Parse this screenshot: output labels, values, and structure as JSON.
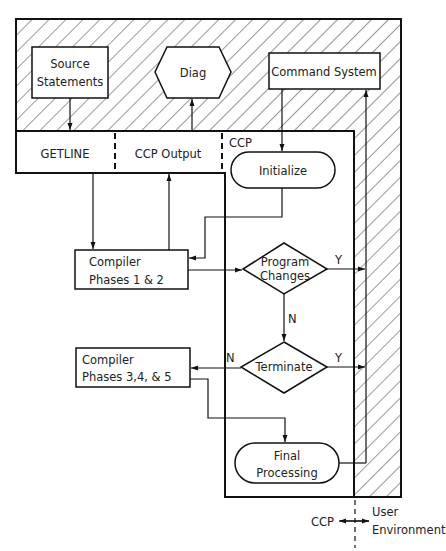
{
  "diagram": {
    "type": "flowchart",
    "regions": {
      "ccp_label": "CCP",
      "divider_left": "CCP",
      "divider_right_line1": "User",
      "divider_right_line2": "Environment"
    },
    "nodes": {
      "source_statements": {
        "line1": "Source",
        "line2": "Statements",
        "shape": "rectangle"
      },
      "diag": {
        "label": "Diag",
        "shape": "hexagon"
      },
      "command_system": {
        "label": "Command System",
        "shape": "rectangle"
      },
      "getline": {
        "label": "GETLINE",
        "shape": "rectangle"
      },
      "ccp_output": {
        "label": "CCP Output",
        "shape": "rectangle"
      },
      "initialize": {
        "label": "Initialize",
        "shape": "terminator"
      },
      "compiler_12": {
        "line1": "Compiler",
        "line2": "Phases 1 & 2",
        "shape": "rectangle"
      },
      "program_changes": {
        "line1": "Program",
        "line2": "Changes",
        "shape": "decision"
      },
      "terminate": {
        "label": "Terminate",
        "shape": "decision"
      },
      "compiler_345": {
        "line1": "Compiler",
        "line2": "Phases 3,4, & 5",
        "shape": "rectangle"
      },
      "final_processing": {
        "line1": "Final",
        "line2": "Processing",
        "shape": "terminator"
      }
    },
    "edge_labels": {
      "program_changes_yes": "Y",
      "program_changes_no": "N",
      "terminate_yes": "Y",
      "terminate_no": "N"
    },
    "edges": [
      {
        "from": "source_statements",
        "to": "getline"
      },
      {
        "from": "ccp_output",
        "to": "diag"
      },
      {
        "from": "command_system",
        "to": "initialize"
      },
      {
        "from": "getline",
        "to": "compiler_12"
      },
      {
        "from": "compiler_12",
        "to": "ccp_output"
      },
      {
        "from": "initialize",
        "to": "compiler_12"
      },
      {
        "from": "compiler_12",
        "to": "program_changes"
      },
      {
        "from": "program_changes",
        "to": "command_system",
        "label": "Y"
      },
      {
        "from": "program_changes",
        "to": "terminate",
        "label": "N"
      },
      {
        "from": "terminate",
        "to": "command_system",
        "label": "Y"
      },
      {
        "from": "terminate",
        "to": "compiler_345",
        "label": "N"
      },
      {
        "from": "compiler_345",
        "to": "final_processing"
      },
      {
        "from": "final_processing",
        "to": "command_system"
      }
    ]
  }
}
